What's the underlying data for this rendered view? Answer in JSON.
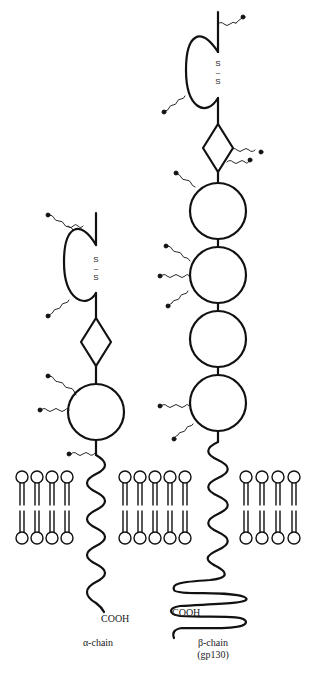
{
  "figure": {
    "alpha_chain": {
      "label": "α-chain",
      "terminus": "COOH",
      "disulfide": [
        "S",
        "–",
        "S"
      ],
      "domains": [
        "loop (Ig-like) with S–S bond",
        "diamond",
        "circle (fibronectin domain)"
      ]
    },
    "beta_chain": {
      "label_line1": "β-chain",
      "label_line2": "(gp130)",
      "terminus": "COOH",
      "disulfide": [
        "S",
        "–",
        "S"
      ],
      "domains": [
        "loop (Ig-like) with S–S bond",
        "diamond",
        "circle",
        "circle",
        "circle",
        "circle"
      ]
    },
    "membrane": {
      "segments": 3,
      "lipids_per_segment": [
        4,
        5,
        4
      ]
    },
    "colors": {
      "stroke": "#111111",
      "background": "#ffffff"
    }
  }
}
